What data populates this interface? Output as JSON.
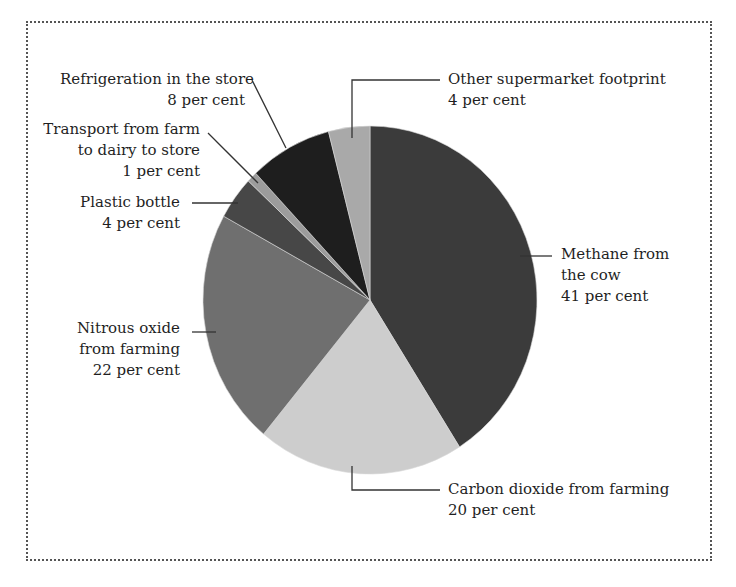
{
  "chart_data": {
    "type": "pie",
    "title": "",
    "start": "top",
    "direction": "clockwise",
    "unit": "per cent",
    "slices": [
      {
        "name": "Methane from the cow",
        "value": 41,
        "color": "#3b3b3b",
        "label_lines": [
          "Methane from",
          "the cow",
          "41 per cent"
        ]
      },
      {
        "name": "Carbon dioxide from farming",
        "value": 20,
        "color": "#cdcdcd",
        "label_lines": [
          "Carbon dioxide from farming",
          "20 per cent"
        ]
      },
      {
        "name": "Nitrous oxide from farming",
        "value": 22,
        "color": "#6f6f6f",
        "label_lines": [
          "Nitrous oxide",
          "from farming",
          "22 per cent"
        ]
      },
      {
        "name": "Plastic bottle",
        "value": 4,
        "color": "#474747",
        "label_lines": [
          "Plastic bottle",
          "4 per cent"
        ]
      },
      {
        "name": "Transport from farm to dairy to store",
        "value": 1,
        "color": "#9c9c9c",
        "label_lines": [
          "Transport from farm",
          "to dairy to store",
          "1 per cent"
        ]
      },
      {
        "name": "Refrigeration in the store",
        "value": 8,
        "color": "#1e1e1e",
        "label_lines": [
          "Refrigeration in the store",
          "8 per cent"
        ]
      },
      {
        "name": "Other supermarket footprint",
        "value": 4,
        "color": "#a9a9a9",
        "label_lines": [
          "Other supermarket footprint",
          "4 per cent"
        ]
      }
    ]
  }
}
